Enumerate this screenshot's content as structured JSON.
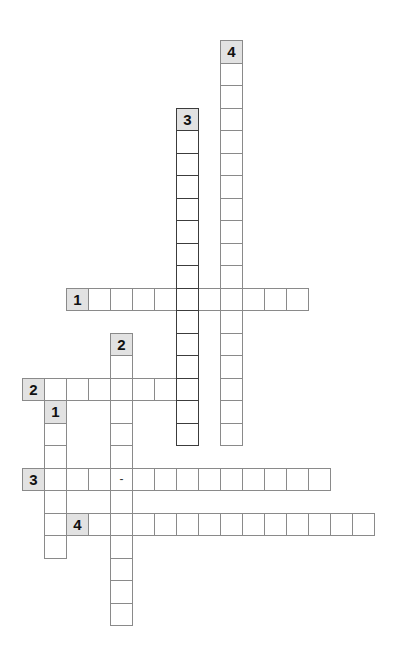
{
  "puzzle": {
    "type": "crossword",
    "grid": {
      "origin_x": 22,
      "origin_y": 40,
      "col_pitch": 22,
      "row_pitch": 22.5
    },
    "colors": {
      "label_bg": "#e2e2e2",
      "grid_line": "#8a8a8a",
      "highlight_border": "#3c3c3c"
    },
    "entries": [
      {
        "id": "4-down",
        "number": "4",
        "direction": "down",
        "col": 9,
        "row": 0,
        "length": 18,
        "highlighted": false
      },
      {
        "id": "3-down",
        "number": "3",
        "direction": "down",
        "col": 7,
        "row": 3,
        "length": 15,
        "highlighted": true
      },
      {
        "id": "1-across",
        "number": "1",
        "direction": "across",
        "col": 2,
        "row": 11,
        "length": 11,
        "highlighted": false
      },
      {
        "id": "2-down",
        "number": "2",
        "direction": "down",
        "col": 4,
        "row": 13,
        "length": 13,
        "highlighted": false
      },
      {
        "id": "2-across",
        "number": "2",
        "direction": "across",
        "col": 0,
        "row": 15,
        "length": 8,
        "highlighted": false
      },
      {
        "id": "1-down",
        "number": "1",
        "direction": "down",
        "col": 1,
        "row": 16,
        "length": 7,
        "highlighted": false
      },
      {
        "id": "3-across",
        "number": "3",
        "direction": "across",
        "col": 0,
        "row": 19,
        "length": 14,
        "highlighted": false,
        "fixed_chars": {
          "4": "-"
        }
      },
      {
        "id": "4-across",
        "number": "4",
        "direction": "across",
        "col": 2,
        "row": 21,
        "length": 14,
        "highlighted": false
      }
    ]
  }
}
